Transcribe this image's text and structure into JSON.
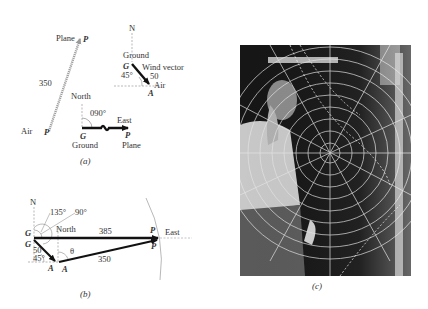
{
  "figure_a": {
    "caption": "(a)",
    "air_vector": {
      "tail_point": "A",
      "tail_label": "Air",
      "head_point": "P",
      "head_label": "Plane",
      "magnitude": "350"
    },
    "wind_vector": {
      "north_label": "N",
      "tail_point": "G",
      "tail_label": "Ground",
      "head_point": "A",
      "head_label": "Air",
      "title": "Wind vector",
      "magnitude": "50",
      "angle": "45°"
    },
    "ground_vector": {
      "north_label": "North",
      "heading": "090°",
      "direction_label": "East",
      "tail_point": "G",
      "tail_label": "Ground",
      "head_point": "P",
      "head_label": "Plane"
    }
  },
  "figure_b": {
    "caption": "(b)",
    "north_label_top": "N",
    "north_label_mid": "North",
    "angle_135": "135°",
    "angle_90": "90°",
    "point_G_upper": "G",
    "point_G_lower": "G",
    "point_A_left": "A",
    "point_A_right": "A",
    "point_P_upper": "P",
    "point_P_lower": "P",
    "east_label": "East",
    "ground_speed": "385",
    "air_speed": "350",
    "wind_speed": "50",
    "wind_angle": "45°",
    "theta": "θ"
  },
  "figure_c": {
    "caption": "(c)",
    "description": "Photograph of an air traffic controller writing on a transparent polar-grid plotting board"
  }
}
